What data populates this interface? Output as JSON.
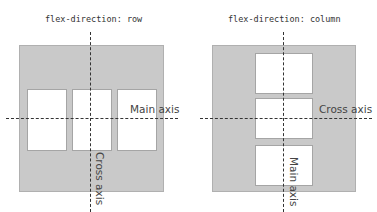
{
  "diagrams": [
    {
      "title": "flex-direction: row",
      "direction": "row",
      "main_axis_label": "Main axis",
      "cross_axis_label": "Cross axis",
      "items": 3
    },
    {
      "title": "flex-direction: column",
      "direction": "column",
      "main_axis_label": "Main axis",
      "cross_axis_label": "Cross axis",
      "items": 3
    }
  ],
  "colors": {
    "container": "#c9c9c9",
    "item": "#ffffff",
    "axis_line": "#333333"
  }
}
